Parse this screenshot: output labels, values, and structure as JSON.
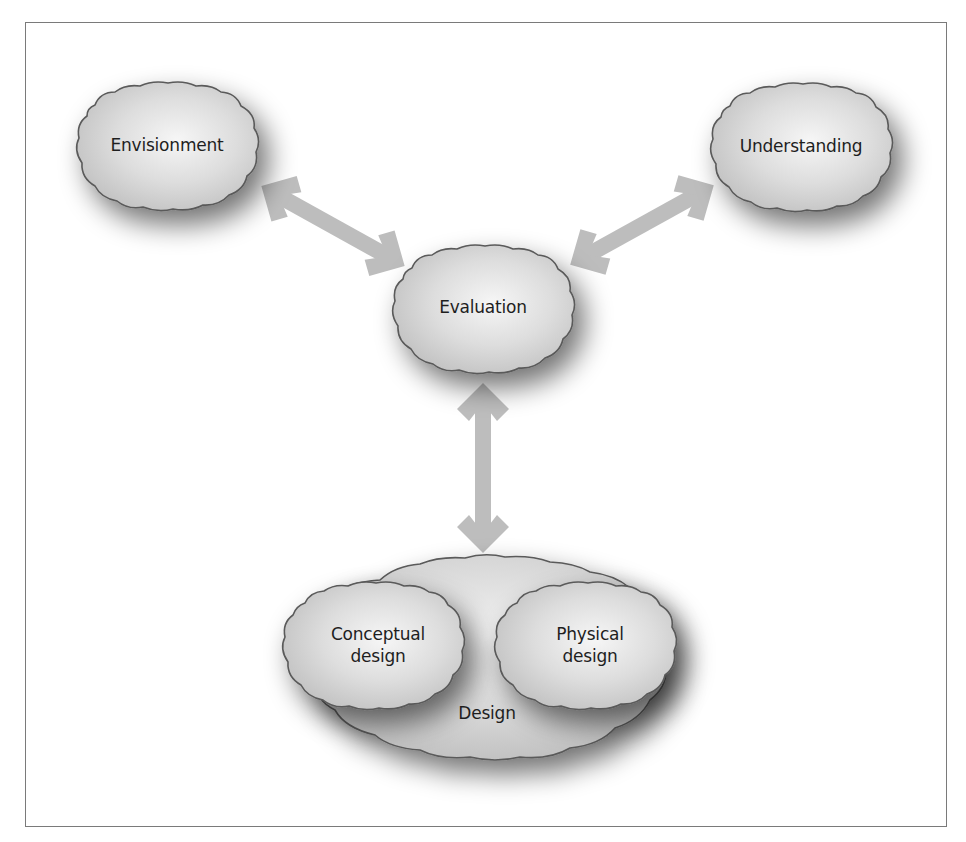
{
  "diagram": {
    "type": "process-cycle",
    "nodes": [
      {
        "id": "envisionment",
        "label": "Envisionment",
        "cx": 167,
        "cy": 145
      },
      {
        "id": "understanding",
        "label": "Understanding",
        "cx": 801,
        "cy": 146
      },
      {
        "id": "evaluation",
        "label": "Evaluation",
        "cx": 483,
        "cy": 307
      },
      {
        "id": "design",
        "label": "Design",
        "cx": 487,
        "cy": 712
      },
      {
        "id": "conceptual-design",
        "label": "Conceptual design",
        "line1": "Conceptual",
        "line2": "design",
        "cx": 378,
        "cy": 644
      },
      {
        "id": "physical-design",
        "label": "Physical design",
        "line1": "Physical",
        "line2": "design",
        "cx": 590,
        "cy": 644
      }
    ],
    "edges": [
      {
        "from": "envisionment",
        "to": "evaluation",
        "bidirectional": true
      },
      {
        "from": "understanding",
        "to": "evaluation",
        "bidirectional": true
      },
      {
        "from": "evaluation",
        "to": "design",
        "bidirectional": true
      }
    ],
    "groups": [
      {
        "container": "design",
        "children": [
          "conceptual-design",
          "physical-design"
        ]
      }
    ],
    "colors": {
      "cloud_fill_center": "#f4f4f4",
      "cloud_fill_edge": "#c4c4c4",
      "cloud_outline": "#5a5a5a",
      "arrow": "#bdbdbd",
      "frame_border": "#7a7a7a",
      "text": "#1e1e1e"
    }
  }
}
